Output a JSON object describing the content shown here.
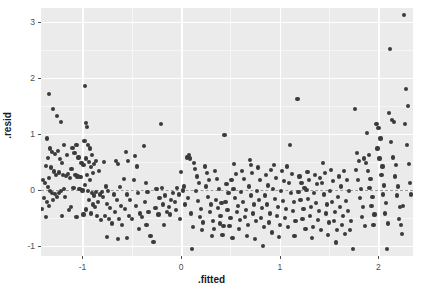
{
  "chart_data": {
    "type": "scatter",
    "title": "",
    "xlabel": ".fitted",
    "ylabel": ".resid",
    "xlim": [
      -1.42,
      2.35
    ],
    "ylim": [
      -1.18,
      3.25
    ],
    "xticks": [
      -1,
      0,
      1,
      2
    ],
    "xtick_labels": [
      "-1",
      "0",
      "1",
      "2"
    ],
    "yticks": [
      -1,
      0,
      1,
      2,
      3
    ],
    "ytick_labels": [
      "-1",
      "0",
      "1",
      "2",
      "3"
    ],
    "grid": true,
    "legend": "none",
    "reference_line": {
      "orientation": "horizontal",
      "y": 0,
      "style": "dashed",
      "color": "#9a9a9a"
    },
    "point_color": "#3b3b3b",
    "panel_background": "#ebebeb",
    "gridline_color": "#ffffff",
    "points": [
      [
        -1.34,
        1.72
      ],
      [
        -1.3,
        1.45
      ],
      [
        -1.26,
        1.32
      ],
      [
        -1.22,
        1.22
      ],
      [
        -1.19,
        0.8
      ],
      [
        -1.36,
        0.92
      ],
      [
        -1.33,
        0.74
      ],
      [
        -1.31,
        0.68
      ],
      [
        -1.28,
        0.64
      ],
      [
        -1.25,
        0.7
      ],
      [
        -1.23,
        0.55
      ],
      [
        -1.21,
        0.48
      ],
      [
        -1.35,
        0.57
      ],
      [
        -1.32,
        0.4
      ],
      [
        -1.29,
        0.33
      ],
      [
        -1.27,
        0.26
      ],
      [
        -1.24,
        0.31
      ],
      [
        -1.2,
        0.27
      ],
      [
        -1.37,
        0.43
      ],
      [
        -1.34,
        0.22
      ],
      [
        -1.38,
        0.12
      ],
      [
        -1.35,
        0.05
      ],
      [
        -1.33,
        -0.02
      ],
      [
        -1.31,
        -0.06
      ],
      [
        -1.28,
        -0.07
      ],
      [
        -1.26,
        -0.12
      ],
      [
        -1.24,
        -0.05
      ],
      [
        -1.22,
        -0.02
      ],
      [
        -1.19,
        0.02
      ],
      [
        -1.17,
        0.25
      ],
      [
        -1.15,
        0.28
      ],
      [
        -1.13,
        0.22
      ],
      [
        -1.39,
        -0.15
      ],
      [
        -1.36,
        -0.22
      ],
      [
        -1.34,
        -0.28
      ],
      [
        -1.3,
        -0.18
      ],
      [
        -1.37,
        -0.48
      ],
      [
        -1.21,
        -0.47
      ],
      [
        -1.1,
        0.75
      ],
      [
        -1.08,
        0.66
      ],
      [
        -1.06,
        0.8
      ],
      [
        -1.04,
        0.58
      ],
      [
        -1.11,
        0.38
      ],
      [
        -1.07,
        0.26
      ],
      [
        -1.05,
        0.24
      ],
      [
        -1.02,
        0.23
      ],
      [
        -1.09,
        0.04
      ],
      [
        -1.03,
        0.02
      ],
      [
        -1.0,
        -0.01
      ],
      [
        -1.12,
        -0.3
      ],
      [
        -1.06,
        -0.48
      ],
      [
        -0.97,
        1.85
      ],
      [
        -0.96,
        1.2
      ],
      [
        -0.95,
        1.12
      ],
      [
        -0.98,
        0.88
      ],
      [
        -0.94,
        0.8
      ],
      [
        -0.92,
        0.74
      ],
      [
        -0.9,
        0.62
      ],
      [
        -0.96,
        0.56
      ],
      [
        -0.93,
        0.5
      ],
      [
        -0.99,
        0.44
      ],
      [
        -0.91,
        0.41
      ],
      [
        -0.89,
        0.3
      ],
      [
        -0.95,
        0.26
      ],
      [
        -0.92,
        0.18
      ],
      [
        -0.97,
        0.09
      ],
      [
        -0.94,
        -0.02
      ],
      [
        -0.9,
        -0.06
      ],
      [
        -0.88,
        -0.1
      ],
      [
        -0.86,
        -0.04
      ],
      [
        -0.93,
        -0.18
      ],
      [
        -0.89,
        -0.26
      ],
      [
        -0.96,
        -0.35
      ],
      [
        -0.91,
        -0.42
      ],
      [
        -0.87,
        -0.3
      ],
      [
        -0.84,
        -0.22
      ],
      [
        -0.82,
        -0.08
      ],
      [
        -0.8,
        -0.04
      ],
      [
        -0.85,
        -0.46
      ],
      [
        -0.81,
        -0.54
      ],
      [
        -0.78,
        0.5
      ],
      [
        -0.76,
        0.06
      ],
      [
        -0.74,
        -0.02
      ],
      [
        -0.79,
        -0.12
      ],
      [
        -0.75,
        -0.25
      ],
      [
        -0.72,
        -0.32
      ],
      [
        -0.77,
        -0.47
      ],
      [
        -0.73,
        -0.52
      ],
      [
        -0.7,
        -0.6
      ],
      [
        -0.75,
        -0.84
      ],
      [
        -0.66,
        0.52
      ],
      [
        -0.64,
        0.46
      ],
      [
        -0.62,
        0.05
      ],
      [
        -0.68,
        -0.08
      ],
      [
        -0.65,
        -0.18
      ],
      [
        -0.61,
        -0.28
      ],
      [
        -0.67,
        -0.4
      ],
      [
        -0.63,
        -0.52
      ],
      [
        -0.6,
        -0.62
      ],
      [
        -0.64,
        -0.88
      ],
      [
        -0.56,
        0.68
      ],
      [
        -0.54,
        0.52
      ],
      [
        -0.58,
        0.2
      ],
      [
        -0.55,
        -0.08
      ],
      [
        -0.52,
        -0.18
      ],
      [
        -0.57,
        -0.34
      ],
      [
        -0.53,
        -0.46
      ],
      [
        -0.5,
        -0.52
      ],
      [
        -0.55,
        -0.86
      ],
      [
        -0.47,
        0.6
      ],
      [
        -0.45,
        0.42
      ],
      [
        -0.48,
        0.18
      ],
      [
        -0.44,
        -0.06
      ],
      [
        -0.46,
        -0.28
      ],
      [
        -0.42,
        -0.42
      ],
      [
        -0.4,
        -0.48
      ],
      [
        -0.43,
        -0.7
      ],
      [
        -0.38,
        0.78
      ],
      [
        -0.36,
        0.12
      ],
      [
        -0.34,
        -0.04
      ],
      [
        -0.37,
        -0.22
      ],
      [
        -0.33,
        -0.4
      ],
      [
        -0.35,
        -0.62
      ],
      [
        -0.31,
        -0.82
      ],
      [
        -0.28,
        -0.93
      ],
      [
        -0.25,
        0.02
      ],
      [
        -0.22,
        -0.14
      ],
      [
        -0.26,
        -0.32
      ],
      [
        -0.23,
        -0.44
      ],
      [
        -0.2,
        1.18
      ],
      [
        -0.19,
        0.04
      ],
      [
        -0.16,
        -0.1
      ],
      [
        -0.18,
        -0.26
      ],
      [
        -0.14,
        -0.4
      ],
      [
        -0.17,
        -0.62
      ],
      [
        -0.12,
        -0.3
      ],
      [
        -0.1,
        -0.18
      ],
      [
        -0.08,
        -0.06
      ],
      [
        -0.11,
        -0.44
      ],
      [
        -0.06,
        -0.22
      ],
      [
        -0.04,
        0.04
      ],
      [
        -0.02,
        -0.08
      ],
      [
        -0.05,
        -0.36
      ],
      [
        -0.01,
        -0.52
      ],
      [
        0.02,
        -0.01
      ],
      [
        0.04,
        -0.26
      ],
      [
        0.0,
        0.32
      ],
      [
        0.06,
        0.58
      ],
      [
        0.08,
        0.62
      ],
      [
        0.09,
        0.56
      ],
      [
        0.07,
        -0.14
      ],
      [
        0.1,
        -0.42
      ],
      [
        0.12,
        -0.66
      ],
      [
        0.11,
        -1.05
      ],
      [
        0.14,
        0.38
      ],
      [
        0.16,
        0.24
      ],
      [
        0.18,
        0.12
      ],
      [
        0.15,
        -0.02
      ],
      [
        0.17,
        -0.2
      ],
      [
        0.2,
        -0.34
      ],
      [
        0.19,
        -0.48
      ],
      [
        0.22,
        -0.58
      ],
      [
        0.24,
        0.42
      ],
      [
        0.26,
        0.3
      ],
      [
        0.28,
        0.18
      ],
      [
        0.25,
        0.06
      ],
      [
        0.27,
        -0.12
      ],
      [
        0.3,
        -0.26
      ],
      [
        0.29,
        -0.4
      ],
      [
        0.32,
        -0.56
      ],
      [
        0.31,
        -0.82
      ],
      [
        0.34,
        0.34
      ],
      [
        0.36,
        0.2
      ],
      [
        0.38,
        0.02
      ],
      [
        0.35,
        -0.18
      ],
      [
        0.37,
        -0.32
      ],
      [
        0.4,
        -0.46
      ],
      [
        0.39,
        -0.6
      ],
      [
        0.42,
        -0.8
      ],
      [
        0.44,
        0.98
      ],
      [
        0.46,
        0.1
      ],
      [
        0.48,
        -0.06
      ],
      [
        0.45,
        -0.22
      ],
      [
        0.47,
        -0.36
      ],
      [
        0.5,
        -0.5
      ],
      [
        0.49,
        -0.64
      ],
      [
        0.52,
        -0.86
      ],
      [
        0.54,
        0.46
      ],
      [
        0.56,
        0.28
      ],
      [
        0.53,
        0.02
      ],
      [
        0.55,
        -0.14
      ],
      [
        0.58,
        -0.28
      ],
      [
        0.57,
        -0.4
      ],
      [
        0.6,
        -0.54
      ],
      [
        0.59,
        -0.7
      ],
      [
        0.62,
        0.34
      ],
      [
        0.64,
        0.2
      ],
      [
        0.61,
        -0.04
      ],
      [
        0.63,
        -0.22
      ],
      [
        0.66,
        -0.36
      ],
      [
        0.65,
        -0.48
      ],
      [
        0.68,
        -0.62
      ],
      [
        0.67,
        -0.82
      ],
      [
        0.7,
        0.54
      ],
      [
        0.72,
        0.3
      ],
      [
        0.69,
        0.06
      ],
      [
        0.71,
        -0.1
      ],
      [
        0.74,
        -0.26
      ],
      [
        0.73,
        -0.42
      ],
      [
        0.76,
        -0.56
      ],
      [
        0.75,
        -0.88
      ],
      [
        0.78,
        0.4
      ],
      [
        0.8,
        0.18
      ],
      [
        0.77,
        -0.02
      ],
      [
        0.79,
        -0.18
      ],
      [
        0.82,
        -0.32
      ],
      [
        0.81,
        -0.5
      ],
      [
        0.84,
        -0.66
      ],
      [
        0.83,
        -1.0
      ],
      [
        0.86,
        0.26
      ],
      [
        0.88,
        0.08
      ],
      [
        0.85,
        -0.1
      ],
      [
        0.87,
        -0.26
      ],
      [
        0.9,
        -0.42
      ],
      [
        0.89,
        -0.58
      ],
      [
        0.92,
        -0.76
      ],
      [
        0.94,
        0.44
      ],
      [
        0.96,
        0.22
      ],
      [
        0.93,
        0.02
      ],
      [
        0.95,
        -0.16
      ],
      [
        0.98,
        -0.3
      ],
      [
        0.97,
        -0.46
      ],
      [
        1.0,
        -0.62
      ],
      [
        0.99,
        -0.84
      ],
      [
        1.02,
        0.34
      ],
      [
        1.04,
        0.16
      ],
      [
        1.01,
        -0.02
      ],
      [
        1.03,
        -0.2
      ],
      [
        1.06,
        -0.34
      ],
      [
        1.05,
        -0.5
      ],
      [
        1.08,
        -0.66
      ],
      [
        1.1,
        0.8
      ],
      [
        1.12,
        0.28
      ],
      [
        1.09,
        0.12
      ],
      [
        1.11,
        -0.06
      ],
      [
        1.14,
        -0.22
      ],
      [
        1.13,
        -0.38
      ],
      [
        1.16,
        -0.56
      ],
      [
        1.15,
        -0.82
      ],
      [
        1.18,
        1.62
      ],
      [
        1.2,
        0.24
      ],
      [
        1.22,
        0.12
      ],
      [
        1.19,
        -0.04
      ],
      [
        1.21,
        -0.18
      ],
      [
        1.24,
        -0.34
      ],
      [
        1.23,
        -0.52
      ],
      [
        1.26,
        -0.7
      ],
      [
        1.28,
        0.32
      ],
      [
        1.3,
        0.18
      ],
      [
        1.27,
        0.0
      ],
      [
        1.29,
        -0.16
      ],
      [
        1.32,
        -0.3
      ],
      [
        1.31,
        -0.46
      ],
      [
        1.34,
        -0.66
      ],
      [
        1.33,
        -0.86
      ],
      [
        1.36,
        0.26
      ],
      [
        1.38,
        0.1
      ],
      [
        1.35,
        -0.06
      ],
      [
        1.37,
        -0.24
      ],
      [
        1.4,
        -0.38
      ],
      [
        1.39,
        -0.54
      ],
      [
        1.42,
        -0.72
      ],
      [
        1.44,
        0.48
      ],
      [
        1.46,
        0.3
      ],
      [
        1.43,
        0.12
      ],
      [
        1.45,
        -0.08
      ],
      [
        1.48,
        -0.26
      ],
      [
        1.47,
        -0.42
      ],
      [
        1.5,
        -0.58
      ],
      [
        1.49,
        -0.8
      ],
      [
        1.52,
        0.36
      ],
      [
        1.54,
        0.16
      ],
      [
        1.51,
        -0.02
      ],
      [
        1.53,
        -0.22
      ],
      [
        1.56,
        -0.4
      ],
      [
        1.55,
        -0.56
      ],
      [
        1.58,
        -0.72
      ],
      [
        1.57,
        -0.94
      ],
      [
        1.6,
        0.24
      ],
      [
        1.62,
        0.06
      ],
      [
        1.59,
        -0.12
      ],
      [
        1.61,
        -0.3
      ],
      [
        1.64,
        -0.46
      ],
      [
        1.63,
        -0.62
      ],
      [
        1.66,
        -0.78
      ],
      [
        1.68,
        0.18
      ],
      [
        1.7,
        -0.02
      ],
      [
        1.67,
        -0.2
      ],
      [
        1.69,
        -0.38
      ],
      [
        1.72,
        -0.56
      ],
      [
        1.71,
        -0.72
      ],
      [
        1.74,
        -1.05
      ],
      [
        1.76,
        1.45
      ],
      [
        1.78,
        0.66
      ],
      [
        1.8,
        0.52
      ],
      [
        1.77,
        0.36
      ],
      [
        1.79,
        0.18
      ],
      [
        1.82,
        0.02
      ],
      [
        1.81,
        -0.14
      ],
      [
        1.84,
        -0.3
      ],
      [
        1.83,
        -0.48
      ],
      [
        1.86,
        -0.64
      ],
      [
        1.88,
        1.02
      ],
      [
        1.9,
        0.62
      ],
      [
        1.87,
        0.48
      ],
      [
        1.89,
        0.34
      ],
      [
        1.92,
        0.2
      ],
      [
        1.91,
        0.04
      ],
      [
        1.94,
        -0.12
      ],
      [
        1.93,
        -0.28
      ],
      [
        1.96,
        -0.44
      ],
      [
        1.95,
        -0.62
      ],
      [
        1.98,
        1.18
      ],
      [
        2.0,
        1.1
      ],
      [
        2.02,
        0.92
      ],
      [
        1.99,
        0.74
      ],
      [
        2.01,
        0.56
      ],
      [
        2.04,
        0.42
      ],
      [
        2.03,
        0.26
      ],
      [
        2.06,
        0.08
      ],
      [
        2.05,
        -0.08
      ],
      [
        2.08,
        -0.24
      ],
      [
        2.07,
        -0.42
      ],
      [
        2.1,
        -0.6
      ],
      [
        2.09,
        -1.05
      ],
      [
        2.12,
        2.52
      ],
      [
        2.14,
        1.25
      ],
      [
        2.16,
        1.22
      ],
      [
        2.13,
        0.86
      ],
      [
        2.15,
        0.58
      ],
      [
        2.18,
        0.44
      ],
      [
        2.17,
        0.24
      ],
      [
        2.2,
        0.06
      ],
      [
        2.19,
        -0.1
      ],
      [
        2.22,
        -0.3
      ],
      [
        2.21,
        -0.52
      ],
      [
        2.24,
        -0.78
      ],
      [
        2.26,
        3.12
      ],
      [
        2.28,
        1.8
      ],
      [
        2.3,
        1.5
      ],
      [
        2.27,
        1.18
      ],
      [
        2.29,
        0.8
      ],
      [
        2.31,
        0.46
      ],
      [
        2.32,
        0.12
      ],
      [
        2.33,
        -0.08
      ],
      [
        2.25,
        -0.28
      ],
      [
        2.23,
        -0.62
      ],
      [
        -1.4,
        0.18
      ],
      [
        -1.41,
        -0.34
      ],
      [
        -1.16,
        0.62
      ],
      [
        -1.14,
        -0.36
      ],
      [
        -1.18,
        -0.12
      ],
      [
        -0.86,
        0.52
      ],
      [
        -0.83,
        0.34
      ],
      [
        -1.01,
        0.48
      ],
      [
        -0.99,
        -0.44
      ],
      [
        -0.88,
        0.46
      ],
      [
        0.03,
        0.06
      ],
      [
        0.13,
        0.48
      ],
      [
        0.21,
        -0.72
      ],
      [
        0.33,
        -0.7
      ],
      [
        0.41,
        -0.24
      ],
      [
        0.51,
        0.18
      ],
      [
        0.43,
        -0.64
      ],
      [
        0.71,
        0.44
      ],
      [
        0.91,
        0.36
      ],
      [
        1.07,
        0.42
      ],
      [
        1.25,
        0.04
      ],
      [
        1.41,
        0.22
      ],
      [
        1.65,
        0.34
      ],
      [
        1.85,
        0.56
      ],
      [
        2.11,
        1.38
      ]
    ]
  },
  "axes": {
    "x_title": ".fitted",
    "y_title": ".resid"
  }
}
